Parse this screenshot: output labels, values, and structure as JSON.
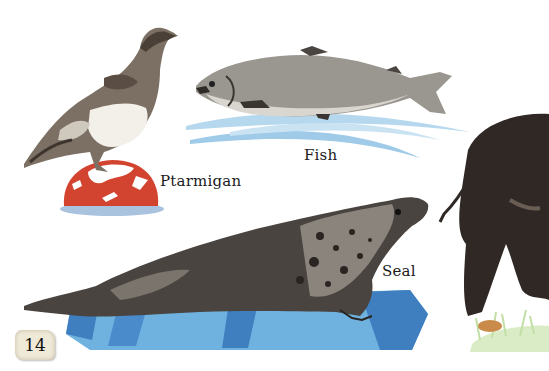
{
  "page": {
    "number": "14",
    "background": "#ffffff"
  },
  "labels": {
    "ptarmigan": "Ptarmigan",
    "fish": "Fish",
    "seal": "Seal"
  },
  "illustrations": [
    {
      "name": "ptarmigan",
      "base": "red snowy dome",
      "colors": {
        "base": "#d2442f",
        "snow": "#ffffff",
        "shadow": "#9fb9d6"
      }
    },
    {
      "name": "fish",
      "base": "water swoosh",
      "colors": {
        "water": "#9fcbe8"
      }
    },
    {
      "name": "seal",
      "base": "ice slab",
      "colors": {
        "ice_light": "#6fb2e0",
        "ice_dark": "#3f7fc0"
      }
    },
    {
      "name": "wild-boar-partial",
      "base": "grass patch",
      "colors": {
        "grass": "#cfe6b8",
        "stone": "#c98a4a"
      }
    }
  ]
}
